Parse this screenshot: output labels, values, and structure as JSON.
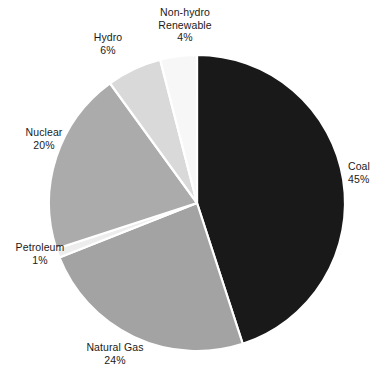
{
  "chart_data": {
    "type": "pie",
    "title": "",
    "subtitle": "",
    "xlabel": "",
    "ylabel": "",
    "legend_position": "none",
    "grid": false,
    "labels_outside": true,
    "start_angle_deg": 0,
    "direction": "clockwise",
    "categories": [
      "Coal",
      "Natural Gas",
      "Petroleum",
      "Nuclear",
      "Hydro",
      "Non-hydro Renewable"
    ],
    "values": [
      45,
      24,
      1,
      20,
      6,
      4
    ],
    "unit": "%",
    "slices": [
      {
        "name": "Coal",
        "label": "Coal",
        "value": 45,
        "value_text": "45%",
        "color": "#191919",
        "start_deg": 0,
        "end_deg": 162
      },
      {
        "name": "Natural Gas",
        "label": "Natural Gas",
        "value": 24,
        "value_text": "24%",
        "color": "#a3a3a3",
        "start_deg": 162,
        "end_deg": 248.4
      },
      {
        "name": "Petroleum",
        "label": "Petroleum",
        "value": 1,
        "value_text": "1%",
        "color": "#ededed",
        "start_deg": 248.4,
        "end_deg": 252
      },
      {
        "name": "Nuclear",
        "label": "Nuclear",
        "value": 20,
        "value_text": "20%",
        "color": "#ababab",
        "start_deg": 252,
        "end_deg": 324
      },
      {
        "name": "Hydro",
        "label": "Hydro",
        "value": 6,
        "value_text": "6%",
        "color": "#d9d9d9",
        "start_deg": 324,
        "end_deg": 345.6
      },
      {
        "name": "Non-hydro Renewable",
        "label_line1": "Non-hydro",
        "label_line2": "Renewable",
        "label": "Non-hydro Renewable",
        "value": 4,
        "value_text": "4%",
        "color": "#f7f7f7",
        "start_deg": 345.6,
        "end_deg": 360
      }
    ],
    "geometry": {
      "center_x": 197,
      "center_y": 203,
      "radius": 148,
      "separator_color": "#ffffff",
      "separator_width": 2.2
    },
    "background_color": "#ffffff",
    "text_color": "#1a1a1a"
  }
}
